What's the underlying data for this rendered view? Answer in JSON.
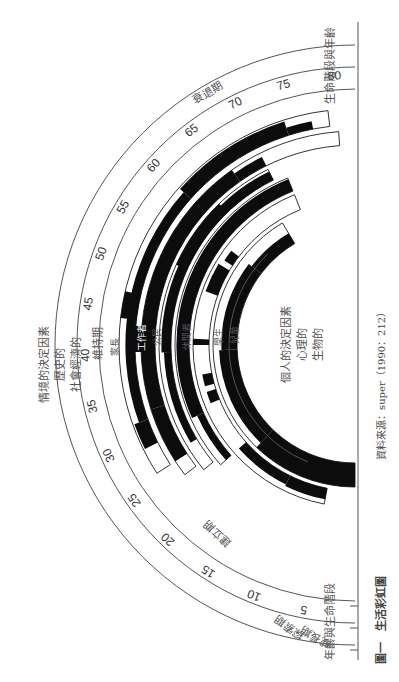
{
  "figure": {
    "caption": "圖一　生活彩虹圖",
    "source": "資料來源：super（1990：212）"
  },
  "axis_labels": {
    "age_and_stage_left": "年齡與生命階段",
    "stage_and_age_right": "生命階段與年齡"
  },
  "stages": [
    {
      "label": "成長期",
      "ring": 1
    },
    {
      "label": "探索期",
      "ring": 2
    },
    {
      "label": "建立期",
      "ring": 3
    },
    {
      "label": "維持期",
      "ring": 3
    },
    {
      "label": "衰退期",
      "ring": 3
    }
  ],
  "ages": [
    "5",
    "10",
    "15",
    "20",
    "25",
    "30",
    "35",
    "40",
    "45",
    "50",
    "55",
    "60",
    "65",
    "70",
    "75",
    "80"
  ],
  "roles": [
    {
      "label": "家長",
      "emphasis": true
    },
    {
      "label": "工作者",
      "emphasis": true,
      "inverted": true
    },
    {
      "label": "公民",
      "emphasis": false
    },
    {
      "label": "休閒者",
      "emphasis": false
    },
    {
      "label": "學生",
      "emphasis": true
    },
    {
      "label": "兒童",
      "emphasis": false
    }
  ],
  "situational_factors": {
    "title": "情境的決定因素",
    "lines": [
      "歷史的",
      "社會經濟的"
    ]
  },
  "personal_factors": {
    "title": "個人的決定因素",
    "lines": [
      "心理的",
      "生物的"
    ]
  },
  "colors": {
    "band": "#0c0c0c",
    "line": "#555555",
    "text": "#555555"
  }
}
